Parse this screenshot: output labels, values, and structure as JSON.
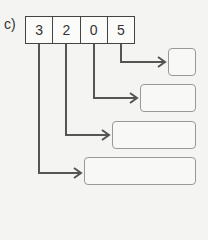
{
  "label": "c)",
  "digits": [
    "3",
    "2",
    "0",
    "5"
  ],
  "answer_boxes": [
    "",
    "",
    "",
    ""
  ],
  "colors": {
    "line": "#555555",
    "box_border": "#999999"
  }
}
